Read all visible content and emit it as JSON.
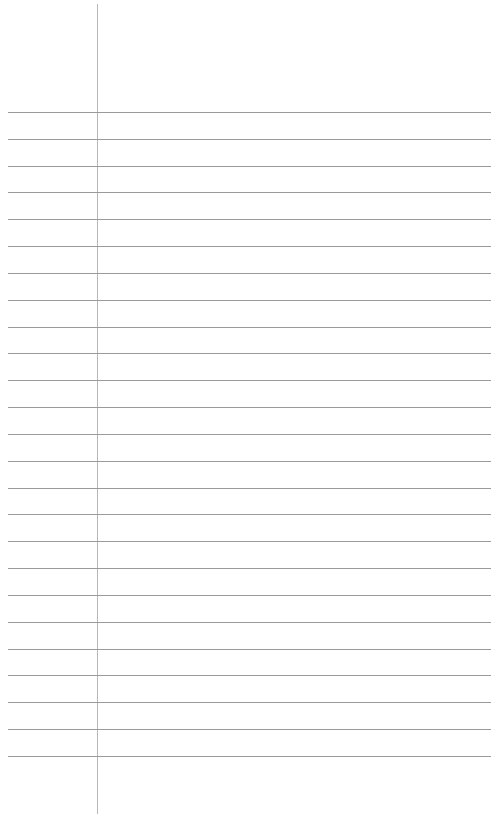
{
  "paper": {
    "type": "lined-notepaper",
    "background_color": "#ffffff",
    "rule_color": "#9a9a9a",
    "margin_line_color": "#b8b8b8",
    "margin_line_x": 97,
    "first_rule_y": 112,
    "rule_spacing": 26.83,
    "rule_count": 25,
    "text": ""
  }
}
